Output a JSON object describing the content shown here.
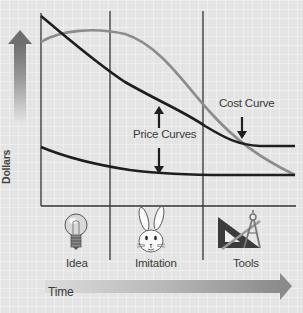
{
  "diagram": {
    "y_axis_label": "Dollars",
    "x_axis_label": "Time",
    "annotations": {
      "price_curves": "Price Curves",
      "cost_curve": "Cost Curve"
    },
    "stages": [
      {
        "label": "Idea",
        "icon": "lightbulb-icon"
      },
      {
        "label": "Imitation",
        "icon": "rabbit-icon"
      },
      {
        "label": "Tools",
        "icon": "drafting-tools-icon"
      }
    ],
    "curves": [
      {
        "name": "upper-price-curve",
        "color": "#1e1e1e"
      },
      {
        "name": "cost-curve",
        "color": "#8c8c8c"
      },
      {
        "name": "lower-price-curve",
        "color": "#1e1e1e"
      }
    ],
    "colors": {
      "background": "#e4e4e4",
      "axis": "#333333",
      "arrow_gradient_start": "#7a7a7a",
      "arrow_gradient_end": "#e0e0e0"
    }
  }
}
